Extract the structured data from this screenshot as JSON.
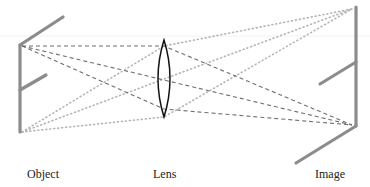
{
  "labels": {
    "object": "Object",
    "lens": "Lens",
    "image": "Image"
  },
  "colors": {
    "figure_gray": "#8c8c8c",
    "dashed_ray": "#6e6e6e",
    "dotted_ray": "#b4b4b4",
    "lens_outline": "#111111",
    "label_text": "#222222"
  },
  "geometry": {
    "object": {
      "stem": [
        [
          20,
          45
        ],
        [
          20,
          132
        ]
      ],
      "head_diag": [
        [
          20,
          45
        ],
        [
          63,
          17
        ]
      ],
      "arm": [
        [
          20,
          90
        ],
        [
          46,
          75
        ]
      ]
    },
    "lens": {
      "cx": 164,
      "top": 40,
      "bottom": 117,
      "half_width": 10
    },
    "image": {
      "stem": [
        [
          356,
          7
        ],
        [
          356,
          126
        ]
      ],
      "arm": [
        [
          356,
          62
        ],
        [
          320,
          84
        ]
      ],
      "foot_diag": [
        [
          356,
          126
        ],
        [
          296,
          163
        ]
      ]
    },
    "dashed_rays_from": [
      22,
      46
    ],
    "dashed_rays_lens_hits": [
      [
        164,
        46
      ],
      [
        164,
        80
      ],
      [
        164,
        109
      ]
    ],
    "dashed_rays_to": [
      352,
      125
    ],
    "dotted_rays_from": [
      22,
      132
    ],
    "dotted_rays_lens_hits": [
      [
        164,
        46
      ],
      [
        164,
        79
      ],
      [
        164,
        117
      ]
    ],
    "dotted_rays_to": [
      352,
      9
    ]
  }
}
